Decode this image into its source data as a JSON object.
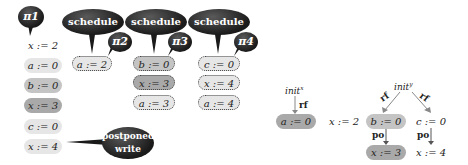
{
  "left_diagram": {
    "threads": [
      {
        "label": "π1",
        "statements": [
          "x := 2",
          "a := 0",
          "b := 0",
          "x := 3",
          "c := 0",
          "x := 4"
        ]
      },
      {
        "label": "π2",
        "statements": [
          "a := 2"
        ]
      },
      {
        "label": "π3",
        "statements": [
          "b := 0",
          "x := 3",
          "a := 3"
        ]
      },
      {
        "label": "π4",
        "statements": [
          "c := 0",
          "x := 4",
          "a := 4"
        ]
      }
    ],
    "callouts": [
      "schedule",
      "schedule",
      "schedule",
      "postponed write"
    ]
  },
  "right_diagram": {
    "init_x": "init",
    "init_x_sup": "x",
    "init_y": "init",
    "init_y_sup": "y",
    "edge_labels": {
      "rf": "rf",
      "po": "po"
    },
    "nodes": [
      "a := 0",
      "x := 2",
      "b := 0",
      "c := 0",
      "x := 3",
      "x := 4"
    ]
  },
  "colors": {
    "light": "#e6e6e6",
    "mid": "#c4c4c4",
    "dark": "#a9a9a9",
    "bubble": "#222222"
  }
}
